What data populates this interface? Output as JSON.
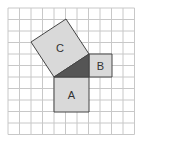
{
  "diagram": {
    "grid": {
      "origin": [
        8,
        8
      ],
      "cell": 11.5,
      "cols": 11,
      "rows": 11,
      "line_color": "#c8c8c8"
    },
    "colors": {
      "square_fill": "#d9d9d9",
      "triangle_fill": "#555555",
      "stroke": "#444444"
    },
    "squares": [
      {
        "label": "C",
        "points": "54,77 89,54 66,19 31,42",
        "label_pos": [
          60,
          48
        ]
      },
      {
        "label": "B",
        "points": "89,54 112,54 112,77 89,77",
        "label_pos": [
          100.5,
          66
        ]
      },
      {
        "label": "A",
        "points": "54,77 89,77 89,112 54,112",
        "label_pos": [
          71.5,
          95
        ]
      }
    ],
    "triangle": {
      "points": "54,77 89,77 89,54"
    }
  }
}
